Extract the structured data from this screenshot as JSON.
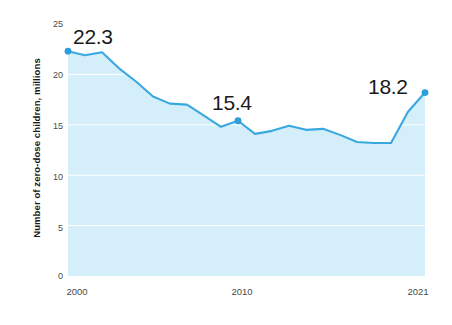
{
  "chart_data": {
    "type": "area",
    "title": "",
    "subtitle": "",
    "xlabel": "",
    "ylabel": "Number of zero-dose children, millions",
    "x": [
      2000,
      2001,
      2002,
      2003,
      2004,
      2005,
      2006,
      2007,
      2008,
      2009,
      2010,
      2011,
      2012,
      2013,
      2014,
      2015,
      2016,
      2017,
      2018,
      2019,
      2020,
      2021
    ],
    "values": [
      22.3,
      21.9,
      22.2,
      20.6,
      19.3,
      17.8,
      17.1,
      17.0,
      15.9,
      14.8,
      15.4,
      14.1,
      14.4,
      14.9,
      14.5,
      14.6,
      14.0,
      13.3,
      13.2,
      13.2,
      16.3,
      18.2
    ],
    "series": [
      {
        "name": "Number of zero-dose children, millions",
        "values": [
          22.3,
          21.9,
          22.2,
          20.6,
          19.3,
          17.8,
          17.1,
          17.0,
          15.9,
          14.8,
          15.4,
          14.1,
          14.4,
          14.9,
          14.5,
          14.6,
          14.0,
          13.3,
          13.2,
          13.2,
          16.3,
          18.2
        ]
      }
    ],
    "xlim": [
      2000,
      2021
    ],
    "ylim": [
      0,
      25
    ],
    "y_ticks": [
      0,
      5,
      10,
      15,
      20,
      25
    ],
    "y_tick_labels": [
      "0",
      "5",
      "10",
      "15",
      "20",
      "25"
    ],
    "x_ticks": [
      2000,
      2010,
      2021
    ],
    "x_tick_labels": [
      "2000",
      "2010",
      "2021"
    ],
    "grid": true,
    "grid_axis": "y",
    "legend": false,
    "legend_position": "none",
    "markers": [
      {
        "x": 2000,
        "y": 22.3,
        "label": "22.3"
      },
      {
        "x": 2010,
        "y": 15.4,
        "label": "15.4"
      },
      {
        "x": 2021,
        "y": 18.2,
        "label": "18.2"
      }
    ],
    "annotations": [
      {
        "text": "22.3",
        "for_x": 2000
      },
      {
        "text": "15.4",
        "for_x": 2010
      },
      {
        "text": "18.2",
        "for_x": 2021
      }
    ],
    "colors": {
      "line": "#3aa8e0",
      "fill": "#d4eff9",
      "marker": "#2e9ddb",
      "gridline": "#ffffff",
      "tick_text": "#4a4a4a",
      "axis_title": "#1a1a1a",
      "annotation_text": "#1a1a1a",
      "background": "#ffffff"
    }
  },
  "axis": {
    "y_title": "Number of zero-dose children, millions",
    "y_labels": [
      "25",
      "20",
      "15",
      "10",
      "5",
      "0"
    ],
    "x_labels": [
      "2000",
      "2010",
      "2021"
    ]
  },
  "annotations": {
    "start": "22.3",
    "mid": "15.4",
    "end": "18.2"
  }
}
